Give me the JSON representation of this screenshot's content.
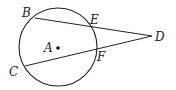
{
  "diagram": {
    "type": "geometry",
    "circle": {
      "center_label": "A",
      "cx": 58,
      "cy": 47,
      "r": 39
    },
    "points": {
      "A": {
        "label": "A",
        "x": 58,
        "y": 48
      },
      "B": {
        "label": "B",
        "x": 35,
        "y": 18
      },
      "C": {
        "label": "C",
        "x": 25,
        "y": 66
      },
      "D": {
        "label": "D",
        "x": 152,
        "y": 36
      },
      "E": {
        "label": "E",
        "x": 93,
        "y": 27
      },
      "F": {
        "label": "F",
        "x": 96,
        "y": 48
      }
    },
    "segments": [
      {
        "from": "B",
        "to": "D"
      },
      {
        "from": "C",
        "to": "D"
      }
    ],
    "colors": {
      "stroke": "#222222",
      "background": "#ffffff"
    }
  }
}
